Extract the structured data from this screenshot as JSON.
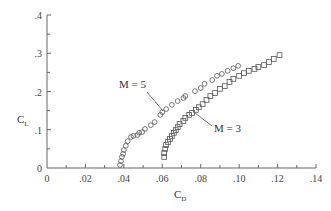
{
  "chart_data": {
    "type": "scatter",
    "title": "",
    "xlabel": "C_D",
    "ylabel": "C_L",
    "xlim": [
      0,
      0.14
    ],
    "ylim": [
      0,
      0.4
    ],
    "grid": false,
    "legend": "inline annotations",
    "x_ticks": [
      "0",
      ".02",
      ".04",
      ".06",
      ".08",
      ".10",
      ".12",
      ".14"
    ],
    "y_ticks": [
      "0",
      ".1",
      ".2",
      ".3",
      ".4"
    ],
    "series": [
      {
        "name": "M = 5",
        "marker": "circle",
        "points": [
          [
            0.038,
            0.008
          ],
          [
            0.0385,
            0.018
          ],
          [
            0.039,
            0.029
          ],
          [
            0.0396,
            0.037
          ],
          [
            0.04,
            0.047
          ],
          [
            0.041,
            0.058
          ],
          [
            0.042,
            0.07
          ],
          [
            0.0437,
            0.081
          ],
          [
            0.045,
            0.084
          ],
          [
            0.047,
            0.086
          ],
          [
            0.048,
            0.092
          ],
          [
            0.0495,
            0.094
          ],
          [
            0.051,
            0.102
          ],
          [
            0.054,
            0.112
          ],
          [
            0.056,
            0.12
          ],
          [
            0.059,
            0.139
          ],
          [
            0.06,
            0.146
          ],
          [
            0.062,
            0.154
          ],
          [
            0.065,
            0.165
          ],
          [
            0.068,
            0.175
          ],
          [
            0.071,
            0.183
          ],
          [
            0.072,
            0.188
          ],
          [
            0.077,
            0.201
          ],
          [
            0.08,
            0.209
          ],
          [
            0.082,
            0.22
          ],
          [
            0.086,
            0.23
          ],
          [
            0.0885,
            0.241
          ],
          [
            0.091,
            0.246
          ],
          [
            0.094,
            0.254
          ],
          [
            0.097,
            0.261
          ],
          [
            0.0995,
            0.267
          ]
        ]
      },
      {
        "name": "M = 3",
        "marker": "square",
        "points": [
          [
            0.061,
            0.029
          ],
          [
            0.061,
            0.039
          ],
          [
            0.0615,
            0.05
          ],
          [
            0.062,
            0.06
          ],
          [
            0.063,
            0.068
          ],
          [
            0.064,
            0.076
          ],
          [
            0.065,
            0.084
          ],
          [
            0.066,
            0.092
          ],
          [
            0.067,
            0.099
          ],
          [
            0.068,
            0.107
          ],
          [
            0.069,
            0.115
          ],
          [
            0.071,
            0.123
          ],
          [
            0.072,
            0.131
          ],
          [
            0.074,
            0.139
          ],
          [
            0.0755,
            0.144
          ],
          [
            0.0775,
            0.152
          ],
          [
            0.079,
            0.159
          ],
          [
            0.081,
            0.167
          ],
          [
            0.083,
            0.178
          ],
          [
            0.085,
            0.188
          ],
          [
            0.0875,
            0.196
          ],
          [
            0.09,
            0.207
          ],
          [
            0.0925,
            0.214
          ],
          [
            0.095,
            0.225
          ],
          [
            0.097,
            0.233
          ],
          [
            0.1,
            0.241
          ],
          [
            0.1025,
            0.248
          ],
          [
            0.105,
            0.254
          ],
          [
            0.108,
            0.259
          ],
          [
            0.11,
            0.264
          ],
          [
            0.113,
            0.269
          ],
          [
            0.1155,
            0.277
          ],
          [
            0.118,
            0.285
          ],
          [
            0.121,
            0.295
          ]
        ]
      }
    ],
    "annotations": [
      {
        "text": "M = 5",
        "x": 0.039,
        "y": 0.22,
        "points_to": [
          0.06,
          0.146
        ]
      },
      {
        "text": "M = 3",
        "x": 0.088,
        "y": 0.105,
        "points_to": [
          0.077,
          0.145
        ]
      }
    ]
  },
  "labels": {
    "ylabel_main": "C",
    "ylabel_sub": "L",
    "xlabel_main": "C",
    "xlabel_sub": "D",
    "m5": "M = 5",
    "m3": "M = 3"
  }
}
